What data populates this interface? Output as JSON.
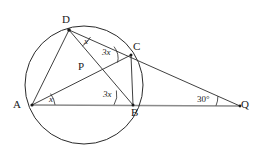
{
  "figure": {
    "type": "circle-geometry-diagram",
    "width": 255,
    "height": 150,
    "background_color": "#ffffff",
    "stroke_color": "#1a1a1a",
    "baseline_color": "#808080"
  },
  "points": {
    "A": {
      "label": "A",
      "x": 32,
      "y": 105,
      "label_x": 13,
      "label_y": 101,
      "on_circle": true
    },
    "B": {
      "label": "B",
      "x": 133,
      "y": 105,
      "label_x": 131,
      "label_y": 108,
      "on_circle": true
    },
    "C": {
      "label": "C",
      "x": 131,
      "y": 55,
      "label_x": 133,
      "label_y": 42,
      "on_circle": true
    },
    "D": {
      "label": "D",
      "x": 69,
      "y": 30,
      "label_x": 63,
      "label_y": 15,
      "on_circle": true
    },
    "P": {
      "label": "P",
      "x": 91,
      "y": 71,
      "label_x": 79,
      "label_y": 62,
      "on_circle": false
    },
    "Q": {
      "label": "Q",
      "x": 240,
      "y": 106,
      "label_x": 241,
      "label_y": 100,
      "on_circle": false
    }
  },
  "circle": {
    "center_x": 84,
    "center_y": 85,
    "radius": 59
  },
  "segments": [
    {
      "name": "chord-AD",
      "from": "A",
      "to": "D"
    },
    {
      "name": "chord-AC",
      "from": "A",
      "to": "C"
    },
    {
      "name": "chord-DB",
      "from": "D",
      "to": "B"
    },
    {
      "name": "chord-BC",
      "from": "B",
      "to": "C"
    },
    {
      "name": "secant-DQ",
      "from": "D",
      "to": "Q"
    },
    {
      "name": "secant-AQ",
      "from": "A",
      "to": "Q"
    }
  ],
  "angles": [
    {
      "id": "angle-at-D",
      "label": "x",
      "vertex": "D",
      "label_x": 84,
      "label_y": 39,
      "italic": true
    },
    {
      "id": "angle-at-C",
      "label": "3x",
      "vertex": "C",
      "label_x": 103,
      "label_y": 50,
      "italic": true
    },
    {
      "id": "angle-at-A",
      "label": "x",
      "vertex": "A",
      "label_x": 49,
      "label_y": 97,
      "italic": true
    },
    {
      "id": "angle-at-B",
      "label": "3x",
      "vertex": "B",
      "label_x": 104,
      "label_y": 92,
      "italic": true
    },
    {
      "id": "angle-at-Q",
      "label": "30°",
      "vertex": "Q",
      "label_x": 198,
      "label_y": 97,
      "italic": false
    }
  ]
}
